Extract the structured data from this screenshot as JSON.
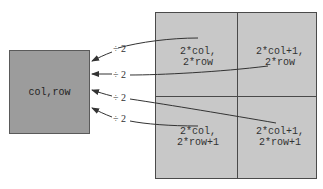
{
  "source": {
    "label": "col,row"
  },
  "grid": {
    "cells": [
      {
        "l1": "2*col,",
        "l2": "2*row"
      },
      {
        "l1": "2*col+1,",
        "l2": "2*row"
      },
      {
        "l1": "2*col,",
        "l2": "2*row+1"
      },
      {
        "l1": "2*col+1,",
        "l2": "2*row+1"
      }
    ]
  },
  "arrows": [
    {
      "label": "÷ 2"
    },
    {
      "label": "÷ 2"
    },
    {
      "label": "÷ 2"
    },
    {
      "label": "÷ 2"
    }
  ],
  "colors": {
    "source_fill": "#9c9c9c",
    "grid_fill": "#c8c8c8",
    "line": "#333333"
  }
}
